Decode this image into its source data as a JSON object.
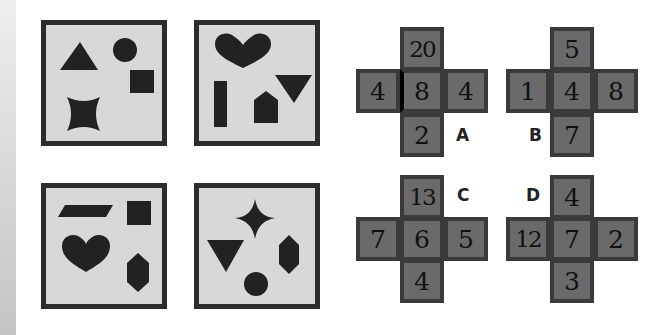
{
  "colors": {
    "panel_fill": "#d8d8d8",
    "panel_border": "#2c2c2c",
    "shape": "#222222",
    "cell_fill": "#6a6a6a",
    "cell_border": "#3a3a3a",
    "number": "#111111"
  },
  "panels": [
    {
      "position": "top-left",
      "shapes": [
        "triangle",
        "circle",
        "square",
        "four-point-star"
      ]
    },
    {
      "position": "top-right",
      "shapes": [
        "heart",
        "inverted-triangle",
        "vertical-rectangle",
        "pentagon-house"
      ]
    },
    {
      "position": "bottom-left",
      "shapes": [
        "parallelogram",
        "square",
        "heart",
        "hexagon"
      ]
    },
    {
      "position": "bottom-right",
      "shapes": [
        "four-point-star",
        "inverted-triangle",
        "hexagon",
        "circle"
      ]
    }
  ],
  "options": [
    {
      "label": "A",
      "top": "20",
      "left": "4",
      "center": "8",
      "right": "4",
      "bottom": "2"
    },
    {
      "label": "B",
      "top": "5",
      "left": "1",
      "center": "4",
      "right": "8",
      "bottom": "7"
    },
    {
      "label": "C",
      "top": "13",
      "left": "7",
      "center": "6",
      "right": "5",
      "bottom": "4"
    },
    {
      "label": "D",
      "top": "4",
      "left": "12",
      "center": "7",
      "right": "2",
      "bottom": "3"
    }
  ]
}
